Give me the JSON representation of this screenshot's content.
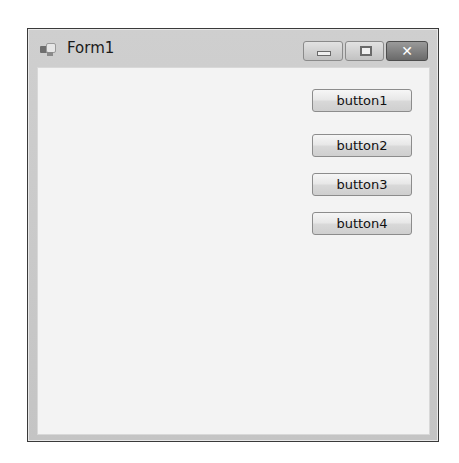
{
  "window": {
    "title": "Form1",
    "icon": "form-app-icon",
    "caption_buttons": {
      "minimize": "minimize-icon",
      "maximize": "maximize-icon",
      "close": "close-icon",
      "close_glyph": "✕"
    }
  },
  "buttons": [
    {
      "label": "button1"
    },
    {
      "label": "button2"
    },
    {
      "label": "button3"
    },
    {
      "label": "button4"
    }
  ]
}
